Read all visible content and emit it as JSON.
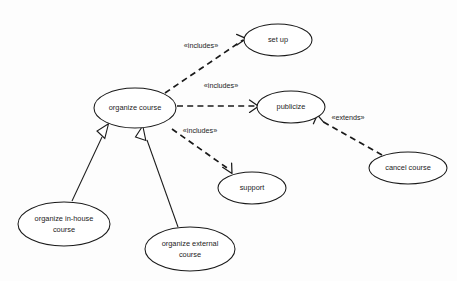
{
  "diagram": {
    "type": "uml-use-case-diagram",
    "title": "",
    "background_color": "#fdfdfd",
    "stroke_color": "#1a1a1a",
    "text_color": "#1c1c1c",
    "use_cases": [
      {
        "id": "organize_course",
        "label": "organize course",
        "lines": [
          "organize course"
        ],
        "cx": 135,
        "cy": 108,
        "rx": 41,
        "ry": 20
      },
      {
        "id": "set_up",
        "label": "set up",
        "lines": [
          "set up"
        ],
        "cx": 278,
        "cy": 40,
        "rx": 34,
        "ry": 16
      },
      {
        "id": "publicize",
        "label": "publicize",
        "lines": [
          "publicize"
        ],
        "cx": 291,
        "cy": 107,
        "rx": 34,
        "ry": 16
      },
      {
        "id": "support",
        "label": "support",
        "lines": [
          "support"
        ],
        "cx": 252,
        "cy": 188,
        "rx": 34,
        "ry": 16
      },
      {
        "id": "cancel_course",
        "label": "cancel course",
        "lines": [
          "cancel course"
        ],
        "cx": 408,
        "cy": 168,
        "rx": 39,
        "ry": 16
      },
      {
        "id": "organize_in_house_course",
        "label": "organize in-house course",
        "lines": [
          "organize in-house",
          "course"
        ],
        "cx": 64,
        "cy": 224,
        "rx": 46,
        "ry": 22
      },
      {
        "id": "organize_external_course",
        "label": "organize external course",
        "lines": [
          "organize external",
          "course"
        ],
        "cx": 190,
        "cy": 249,
        "rx": 45,
        "ry": 22
      }
    ],
    "relationships": [
      {
        "id": "rel_includes_set_up",
        "kind": "include",
        "stereotype": "«includes»",
        "from": "organize_course",
        "to": "set_up",
        "label_x": 201,
        "label_y": 46,
        "x1": 165,
        "y1": 93,
        "x2": 246,
        "y2": 38
      },
      {
        "id": "rel_includes_publicize",
        "kind": "include",
        "stereotype": "«includes»",
        "from": "organize_course",
        "to": "publicize",
        "label_x": 221,
        "label_y": 86,
        "x1": 177,
        "y1": 106,
        "x2": 257,
        "y2": 106
      },
      {
        "id": "rel_includes_support",
        "kind": "include",
        "stereotype": "«includes»",
        "from": "organize_course",
        "to": "support",
        "label_x": 200,
        "label_y": 131,
        "x1": 172,
        "y1": 128,
        "x2": 231,
        "y2": 172
      },
      {
        "id": "rel_extends_publicize",
        "kind": "extend",
        "stereotype": "«extends»",
        "from": "cancel_course",
        "to": "publicize",
        "label_x": 348,
        "label_y": 118,
        "x1": 381,
        "y1": 154,
        "x2": 317,
        "y2": 118
      },
      {
        "id": "rel_gen_in_house",
        "kind": "generalization",
        "stereotype": "",
        "from": "organize_in_house_course",
        "to": "organize_course",
        "x1": 72,
        "y1": 202,
        "x2": 108,
        "y2": 125
      },
      {
        "id": "rel_gen_external",
        "kind": "generalization",
        "stereotype": "",
        "from": "organize_external_course",
        "to": "organize_course",
        "x1": 178,
        "y1": 227,
        "x2": 142,
        "y2": 127
      }
    ]
  }
}
